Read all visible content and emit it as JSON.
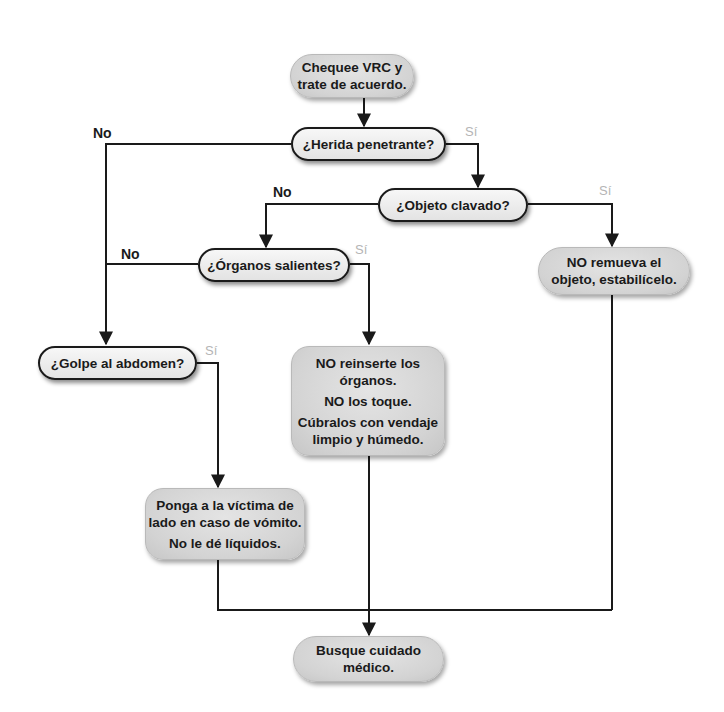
{
  "flowchart": {
    "nodes": {
      "start": {
        "lines": [
          "Chequee VRC y",
          "trate de acuerdo."
        ],
        "type": "action"
      },
      "herida": {
        "lines": [
          "¿Herida penetrante?"
        ],
        "type": "decision"
      },
      "objeto": {
        "lines": [
          "¿Objeto clavado?"
        ],
        "type": "decision"
      },
      "no_remueva": {
        "lines": [
          "NO remueva el",
          "objeto, estabilícelo."
        ],
        "type": "action"
      },
      "organos": {
        "lines": [
          "¿Órganos salientes?"
        ],
        "type": "decision"
      },
      "golpe": {
        "lines": [
          "¿Golpe al abdomen?"
        ],
        "type": "decision"
      },
      "no_reinserte": {
        "lines": [
          "NO reinserte los",
          "órganos.",
          "NO los toque.",
          "Cúbralos con vendaje",
          "limpio y húmedo."
        ],
        "type": "action"
      },
      "ponga": {
        "lines": [
          "Ponga a la víctima de",
          "lado en caso de vómito.",
          "No le dé líquidos."
        ],
        "type": "action"
      },
      "busque": {
        "lines": [
          "Busque cuidado",
          "médico."
        ],
        "type": "action"
      }
    },
    "edge_labels": {
      "herida_no": "No",
      "herida_si": "Sí",
      "objeto_no": "No",
      "objeto_si": "Sí",
      "organos_no": "No",
      "organos_si": "Sí",
      "golpe_si": "Sí"
    },
    "edges": [
      {
        "from": "start",
        "to": "herida"
      },
      {
        "from": "herida",
        "to": "golpe",
        "label": "No"
      },
      {
        "from": "herida",
        "to": "objeto",
        "label": "Sí"
      },
      {
        "from": "objeto",
        "to": "organos",
        "label": "No"
      },
      {
        "from": "objeto",
        "to": "no_remueva",
        "label": "Sí"
      },
      {
        "from": "organos",
        "to": "golpe",
        "label": "No"
      },
      {
        "from": "organos",
        "to": "no_reinserte",
        "label": "Sí"
      },
      {
        "from": "golpe",
        "to": "ponga",
        "label": "Sí"
      },
      {
        "from": "ponga",
        "to": "busque"
      },
      {
        "from": "no_reinserte",
        "to": "busque"
      },
      {
        "from": "no_remueva",
        "to": "busque"
      }
    ],
    "colors": {
      "line": "#1a1a1a",
      "action_fill": "#d6d6d6",
      "decision_fill": "#efefef",
      "si_label": "#b5b5b5",
      "no_label": "#1a1a1a"
    }
  }
}
